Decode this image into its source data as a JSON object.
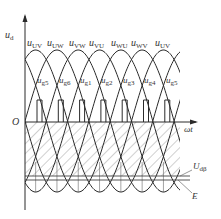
{
  "diagram": {
    "type": "waveform",
    "axes": {
      "y_label_base": "u",
      "y_label_sub": "d",
      "x_label": "ωt",
      "origin_label": "O"
    },
    "line_voltage_labels": [
      {
        "base": "u",
        "sub": "UV"
      },
      {
        "base": "u",
        "sub": "UW"
      },
      {
        "base": "u",
        "sub": "VW"
      },
      {
        "base": "u",
        "sub": "VU"
      },
      {
        "base": "u",
        "sub": "WU"
      },
      {
        "base": "u",
        "sub": "WV"
      },
      {
        "base": "u",
        "sub": "UV"
      }
    ],
    "gate_pulse_labels": [
      {
        "base": "u",
        "sub": "g5"
      },
      {
        "base": "u",
        "sub": "g6"
      },
      {
        "base": "u",
        "sub": "g1"
      },
      {
        "base": "u",
        "sub": "g2"
      },
      {
        "base": "u",
        "sub": "g3"
      },
      {
        "base": "u",
        "sub": "g4"
      },
      {
        "base": "u",
        "sub": "g5"
      }
    ],
    "level_labels": {
      "udb_base": "U",
      "udb_sub": "dβ",
      "e": "E"
    },
    "colors": {
      "line": "#2a2a2a",
      "hatch": "#888888",
      "text": "#333333"
    }
  }
}
